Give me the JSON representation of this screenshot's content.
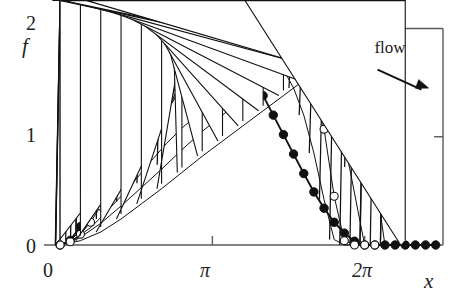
{
  "chart_data": {
    "type": "line",
    "title": "",
    "subtitle": "",
    "xlabel": "x",
    "ylabel": "f",
    "xlim": [
      -0.25,
      7.9
    ],
    "ylim": [
      0,
      2.06
    ],
    "xticks": [
      0,
      3.14159,
      6.28319
    ],
    "xticklabels": [
      "0",
      "π",
      "2π"
    ],
    "yticks": [
      0,
      1,
      2
    ],
    "yticklabels": [
      "0",
      "1",
      "2"
    ],
    "grid": false,
    "legend": "none",
    "annotations": [
      {
        "name": "flow-label",
        "text": "flow",
        "x": 7.0,
        "y": 1.82
      },
      {
        "name": "flow-arrow",
        "text": "→",
        "x0": 6.55,
        "y0": 1.62,
        "x1": 7.6,
        "y1": 1.45
      }
    ],
    "series": [
      {
        "name": "t0",
        "marker": "filled-circle",
        "linewidth": 1.9,
        "x": [
          0.0,
          0.209,
          0.419,
          0.628,
          0.838,
          1.047,
          1.257,
          1.466,
          1.676,
          1.885,
          2.094,
          2.304,
          2.513,
          2.723,
          2.932,
          3.142,
          3.351,
          3.561,
          3.77,
          3.98,
          4.189,
          4.398,
          4.608,
          4.817,
          5.027,
          5.236,
          5.446,
          5.655,
          5.864,
          6.074,
          6.283,
          6.493,
          6.702,
          6.912,
          7.121,
          7.33,
          7.54,
          7.749
        ],
        "y": [
          0.0,
          0.043,
          0.17,
          0.375,
          0.646,
          0.965,
          1.315,
          1.658,
          1.799,
          1.92,
          1.985,
          2.0,
          1.995,
          1.985,
          1.99,
          2.0,
          1.96,
          1.86,
          1.72,
          1.56,
          1.38,
          1.2,
          1.02,
          0.84,
          0.66,
          0.49,
          0.34,
          0.21,
          0.11,
          0.035,
          0.0,
          0.0,
          0.0,
          0.0,
          0.0,
          0.0,
          0.0,
          0.0
        ]
      },
      {
        "name": "t1",
        "marker": "asterisk",
        "linewidth": 1.0,
        "x": [
          0.0,
          0.209,
          0.419,
          0.628,
          0.838,
          1.047,
          1.257,
          1.466,
          1.676,
          1.885,
          2.094,
          2.304,
          2.513,
          2.723,
          2.932,
          3.142,
          3.351,
          3.561,
          3.77,
          3.98,
          4.189,
          4.398,
          4.608,
          4.817,
          5.027,
          5.236,
          5.446,
          5.655,
          5.864,
          6.074,
          6.283,
          6.493,
          6.702
        ],
        "y": [
          0.0,
          0.04,
          0.13,
          0.28,
          0.48,
          0.72,
          0.99,
          1.26,
          1.5,
          1.69,
          1.82,
          1.88,
          1.9,
          1.88,
          1.84,
          1.78,
          1.76,
          1.78,
          1.8,
          1.8,
          1.78,
          1.73,
          1.62,
          1.45,
          1.2,
          0.85,
          0.42,
          0.05,
          0.0,
          0.0,
          0.0,
          0.0,
          0.0
        ]
      },
      {
        "name": "t2",
        "marker": "open-circle",
        "linewidth": 1.0,
        "x": [
          0.0,
          0.209,
          0.419,
          0.628,
          0.838,
          1.047,
          1.257,
          1.466,
          1.676,
          1.885,
          2.094,
          2.304,
          2.513,
          2.723,
          2.932,
          3.142,
          3.351,
          3.561,
          3.77,
          3.98,
          4.189,
          4.398,
          4.608,
          4.817,
          5.027,
          5.236,
          5.446,
          5.655,
          5.864,
          6.074,
          6.283,
          6.493
        ],
        "y": [
          0.0,
          0.03,
          0.1,
          0.21,
          0.36,
          0.53,
          0.72,
          0.92,
          1.11,
          1.28,
          1.43,
          1.55,
          1.65,
          1.72,
          1.78,
          1.82,
          1.85,
          1.86,
          1.85,
          1.83,
          1.81,
          1.8,
          1.79,
          1.77,
          1.7,
          1.52,
          1.07,
          0.45,
          0.04,
          0.0,
          0.0,
          0.0
        ]
      },
      {
        "name": "t3",
        "marker": "plus",
        "linewidth": 1.0,
        "x": [
          0.0,
          0.314,
          0.628,
          0.942,
          1.257,
          1.571,
          1.885,
          2.199,
          2.513,
          2.827,
          3.142,
          3.456,
          3.77,
          4.084,
          4.398,
          4.712,
          5.027,
          5.341,
          5.655,
          5.969,
          6.283
        ],
        "y": [
          0.0,
          0.06,
          0.16,
          0.3,
          0.45,
          0.61,
          0.78,
          0.94,
          1.08,
          1.2,
          1.32,
          1.45,
          1.57,
          1.66,
          1.73,
          1.77,
          1.78,
          1.72,
          1.38,
          0.72,
          0.0
        ]
      },
      {
        "name": "t4",
        "marker": "cross",
        "linewidth": 1.0,
        "x": [
          0.0,
          0.419,
          0.838,
          1.257,
          1.676,
          2.094,
          2.513,
          2.932,
          3.351,
          3.77,
          4.189,
          4.608,
          5.027,
          5.446,
          5.864,
          6.283,
          6.702
        ],
        "y": [
          0.0,
          0.07,
          0.2,
          0.36,
          0.53,
          0.7,
          0.88,
          1.05,
          1.2,
          1.36,
          1.52,
          1.65,
          1.74,
          1.78,
          1.72,
          1.3,
          0.0
        ]
      },
      {
        "name": "t5",
        "marker": "open-triangle",
        "linewidth": 1.0,
        "x": [
          0.0,
          0.419,
          0.838,
          1.257,
          1.676,
          2.094,
          2.513,
          2.932,
          3.351,
          3.77,
          4.189,
          4.608,
          5.027,
          5.446,
          5.864,
          6.283,
          6.702,
          7.121
        ],
        "y": [
          0.0,
          0.04,
          0.12,
          0.24,
          0.38,
          0.52,
          0.67,
          0.82,
          0.96,
          1.1,
          1.24,
          1.38,
          1.52,
          1.63,
          1.7,
          1.68,
          1.46,
          0.0
        ]
      }
    ]
  },
  "plot": {
    "box": {
      "left": 48,
      "right": 443,
      "top": 22,
      "bottom": 245
    },
    "colors": {
      "axis": "#5a5a5a",
      "curve": "#111111",
      "text": "#222222"
    }
  }
}
